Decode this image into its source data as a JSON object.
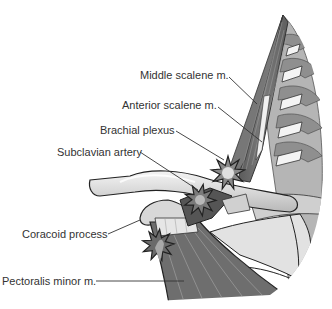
{
  "figure": {
    "style": "grayscale illustration",
    "colors": {
      "background": "#ffffff",
      "outline": "#222222",
      "muscle": "#6e6e6e",
      "muscle_light": "#9a9a9a",
      "bone": "#d6d6d6",
      "bone_highlight": "#f2f2f2",
      "vertebra": "#a8a8a8",
      "star_fill": "#8a8a8a",
      "star_center": "#e8e8e8",
      "leader_line": "#333333",
      "text": "#333333"
    },
    "labels": [
      {
        "id": "middle-scalene",
        "text": "Middle scalene m."
      },
      {
        "id": "anterior-scalene",
        "text": "Anterior scalene m."
      },
      {
        "id": "brachial-plexus",
        "text": "Brachial plexus"
      },
      {
        "id": "subclavian-artery",
        "text": "Subclavian artery"
      },
      {
        "id": "coracoid-process",
        "text": "Coracoid process"
      },
      {
        "id": "pectoralis-minor",
        "text": "Pectoralis minor m."
      }
    ],
    "compression_markers": [
      {
        "id": "scalene-triangle",
        "shape": "star"
      },
      {
        "id": "costoclavicular-space",
        "shape": "star"
      },
      {
        "id": "subcoracoid-space",
        "shape": "star"
      }
    ]
  }
}
